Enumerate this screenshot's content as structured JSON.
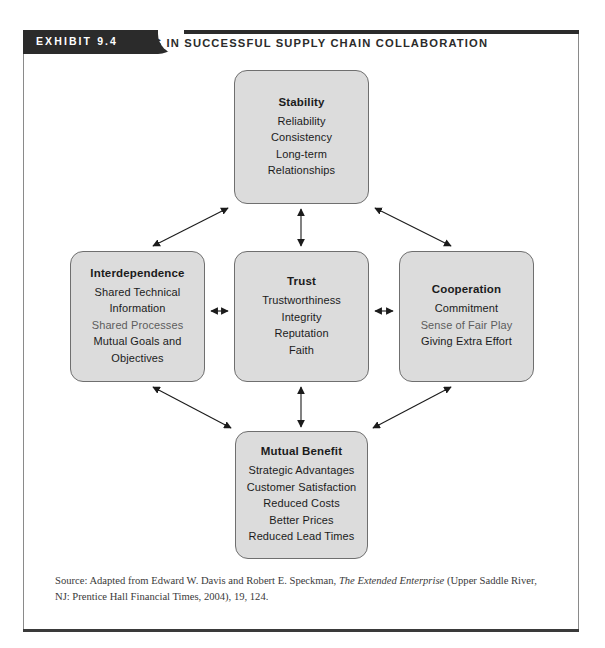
{
  "exhibit": {
    "tab_label": "EXHIBIT 9.4",
    "title": "FACTORS IN SUCCESSFUL SUPPLY CHAIN COLLABORATION"
  },
  "diagram": {
    "nodes": [
      {
        "id": "stability",
        "title": "Stability",
        "items": [
          "Reliability",
          "Consistency",
          "Long-term",
          "Relationships"
        ]
      },
      {
        "id": "interdependence",
        "title": "Interdependence",
        "items": [
          "Shared Technical",
          "Information",
          "Shared Processes",
          "Mutual Goals and",
          "Objectives"
        ]
      },
      {
        "id": "trust",
        "title": "Trust",
        "items": [
          "Trustworthiness",
          "Integrity",
          "Reputation",
          "Faith"
        ]
      },
      {
        "id": "cooperation",
        "title": "Cooperation",
        "items": [
          "Commitment",
          "Sense of Fair Play",
          "Giving Extra Effort"
        ]
      },
      {
        "id": "mutual-benefit",
        "title": "Mutual Benefit",
        "items": [
          "Strategic Advantages",
          "Customer Satisfaction",
          "Reduced Costs",
          "Better Prices",
          "Reduced Lead Times"
        ]
      }
    ],
    "connector_style": "double-headed-arrow",
    "connections": [
      {
        "from": "interdependence",
        "to": "stability"
      },
      {
        "from": "trust",
        "to": "stability"
      },
      {
        "from": "cooperation",
        "to": "stability"
      },
      {
        "from": "interdependence",
        "to": "trust"
      },
      {
        "from": "trust",
        "to": "cooperation"
      },
      {
        "from": "interdependence",
        "to": "mutual-benefit"
      },
      {
        "from": "trust",
        "to": "mutual-benefit"
      },
      {
        "from": "cooperation",
        "to": "mutual-benefit"
      }
    ]
  },
  "source": {
    "prefix": "Source: Adapted from Edward W. Davis and Robert E. Speckman, ",
    "italic_title": "The Extended Enterprise",
    "suffix": " (Upper Saddle River, NJ: Prentice Hall Financial Times, 2004), 19, 124."
  },
  "colors": {
    "box_fill": "#dcdcdc",
    "box_border": "#6f6f6f",
    "tab_background": "#2b2b2b",
    "tab_text": "#ffffff",
    "frame_border": "#8a8a8a"
  }
}
